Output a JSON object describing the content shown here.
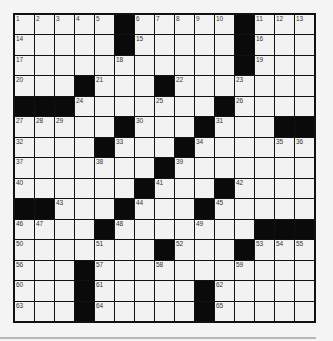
{
  "puzzle": {
    "rows": 15,
    "cols": 15,
    "grid": [
      [
        "1",
        "2",
        "3",
        "4",
        "5",
        "#",
        "6",
        "7",
        "8",
        "9",
        "10",
        "#",
        "11",
        "12",
        "13"
      ],
      [
        "14",
        "",
        "",
        "",
        "",
        "#",
        "15",
        "",
        "",
        "",
        "",
        "#",
        "16",
        "",
        ""
      ],
      [
        "17",
        "",
        "",
        "",
        "",
        "18",
        "",
        "",
        "",
        "",
        "",
        "#",
        "19",
        "",
        ""
      ],
      [
        "20",
        "",
        "",
        "#",
        "21",
        "",
        "",
        "#",
        "22",
        "",
        "",
        "23",
        "",
        "",
        ""
      ],
      [
        "#",
        "#",
        "#",
        "24",
        "",
        "",
        "",
        "25",
        "",
        "",
        "#",
        "26",
        "",
        "",
        ""
      ],
      [
        "27",
        "28",
        "29",
        "",
        "",
        "#",
        "30",
        "",
        "",
        "#",
        "31",
        "",
        "",
        "#",
        "#"
      ],
      [
        "32",
        "",
        "",
        "",
        "#",
        "33",
        "",
        "",
        "#",
        "34",
        "",
        "",
        "",
        "35",
        "36"
      ],
      [
        "37",
        "",
        "",
        "",
        "38",
        "",
        "",
        "#",
        "39",
        "",
        "",
        "",
        "",
        "",
        ""
      ],
      [
        "40",
        "",
        "",
        "",
        "",
        "",
        "#",
        "41",
        "",
        "",
        "#",
        "42",
        "",
        "",
        ""
      ],
      [
        "#",
        "#",
        "43",
        "",
        "",
        "#",
        "44",
        "",
        "",
        "#",
        "45",
        "",
        "",
        "",
        ""
      ],
      [
        "46",
        "47",
        "",
        "",
        "#",
        "48",
        "",
        "",
        "",
        "49",
        "",
        "",
        "#",
        "#",
        "#"
      ],
      [
        "50",
        "",
        "",
        "",
        "51",
        "",
        "",
        "#",
        "52",
        "",
        "",
        "#",
        "53",
        "54",
        "55"
      ],
      [
        "56",
        "",
        "",
        "#",
        "57",
        "",
        "",
        "58",
        "",
        "",
        "",
        "59",
        "",
        "",
        ""
      ],
      [
        "60",
        "",
        "",
        "#",
        "61",
        "",
        "",
        "",
        "",
        "#",
        "62",
        "",
        "",
        "",
        ""
      ],
      [
        "63",
        "",
        "",
        "#",
        "64",
        "",
        "",
        "",
        "",
        "#",
        "65",
        "",
        "",
        "",
        ""
      ]
    ]
  },
  "colors": {
    "cell_fill": "#f2f2f2",
    "block_fill": "#0a0a0a",
    "grid_line": "#111111",
    "page_bg": "#f4f4f4",
    "footer_line": "#b8b8b8"
  }
}
